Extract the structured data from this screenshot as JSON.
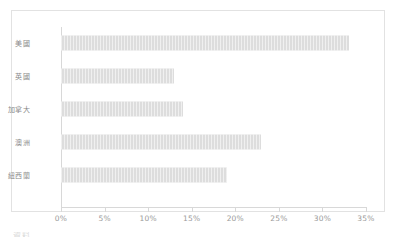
{
  "chart_data": {
    "type": "bar",
    "orientation": "horizontal",
    "title": "",
    "xlabel": "",
    "ylabel": "",
    "categories": [
      "美國",
      "英國",
      "加拿大",
      "澳洲",
      "紐西蘭"
    ],
    "values": [
      33,
      13,
      14,
      23,
      19
    ],
    "value_unit": "%",
    "xlim": [
      0,
      35
    ],
    "xticks": [
      0,
      5,
      10,
      15,
      20,
      25,
      30,
      35
    ],
    "xtick_labels": [
      "0%",
      "5%",
      "10%",
      "15%",
      "20%",
      "25%",
      "30%",
      "35%"
    ],
    "grid": false,
    "legend": false,
    "series": [
      {
        "name": "",
        "values": [
          33,
          13,
          14,
          23,
          19
        ]
      }
    ]
  },
  "style": {
    "bar_color": "#dddddd",
    "axis_color": "#d8d8d8",
    "frame_border_color": "#e2e2e2",
    "label_color": "#8a8a8a",
    "tick_label_color": "#9a9a9a",
    "background": "#ffffff"
  },
  "caption": {
    "clipped_text": "資料"
  }
}
